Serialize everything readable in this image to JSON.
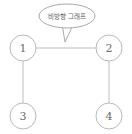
{
  "canvas": {
    "width": 132,
    "height": 134,
    "background_color": "#ffffff"
  },
  "diagram": {
    "type": "undirected-graph",
    "title_bubble": {
      "text": "비방향 그래프",
      "shape": "speech-bubble-ellipse",
      "outline_color": "#a9a9a9",
      "text_color": "#5a5a5a",
      "tail_direction": "down"
    },
    "node_style": {
      "shape": "circle",
      "radius": 13,
      "outline_color": "#b9b9b9",
      "fill_color": "#ffffff",
      "label_color": "#6b6b6b"
    },
    "edge_style": {
      "color": "#bdbdbd",
      "directed": false,
      "arrowheads": "none"
    },
    "nodes": [
      {
        "id": "1",
        "label": "1",
        "cx": 23,
        "cy": 48
      },
      {
        "id": "2",
        "label": "2",
        "cx": 109,
        "cy": 48
      },
      {
        "id": "3",
        "label": "3",
        "cx": 23,
        "cy": 116
      },
      {
        "id": "4",
        "label": "4",
        "cx": 109,
        "cy": 116
      }
    ],
    "edges": [
      {
        "from": "1",
        "to": "2",
        "orientation": "horizontal"
      },
      {
        "from": "1",
        "to": "3",
        "orientation": "vertical"
      },
      {
        "from": "2",
        "to": "4",
        "orientation": "vertical"
      }
    ]
  }
}
